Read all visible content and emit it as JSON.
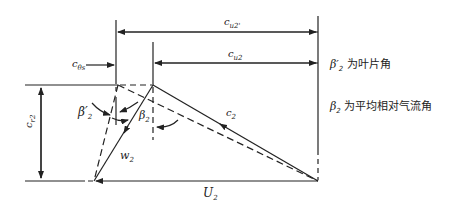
{
  "figure": {
    "labels": {
      "c_u2_inf": "c",
      "c_u2_inf_sub": "u2'",
      "c_u2": "c",
      "c_u2_sub": "u2",
      "delta_c_u": "c",
      "delta_c_u_sub": "θs",
      "c_r2": "c",
      "c_r2_sub": "r2",
      "beta2_prime": "β′",
      "beta2_prime_sub": "2",
      "beta2": "β",
      "beta2_sub": "2",
      "c2": "c",
      "c2_sub": "2",
      "w2": "w",
      "w2_sub": "2",
      "U2": "U",
      "U2_sub": "2"
    },
    "legend": [
      {
        "symbol": "β′",
        "sub": "2",
        "text": "为叶片角"
      },
      {
        "symbol": "β",
        "sub": "2",
        "text": "为平均相对气流角"
      }
    ],
    "colors": {
      "line": "#222222",
      "background": "#ffffff"
    }
  }
}
